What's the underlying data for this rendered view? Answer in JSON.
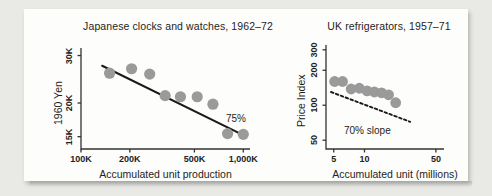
{
  "page": {
    "background_color": "#e9e9e6",
    "card_color": "#fdfdfb"
  },
  "style": {
    "marker_color": "#9a9a9a",
    "line_color": "#1a1a1a",
    "axis_color": "#333333",
    "text_color": "#1d1d1d"
  },
  "chart_data": [
    {
      "id": "japanese-clocks-watches",
      "type": "scatter",
      "title": "Japanese clocks and watches, 1962–72",
      "xlabel": "Accumulated unit production",
      "ylabel": "1960 Yen",
      "xscale": "log",
      "yscale": "log",
      "xticks": [
        "100K",
        "200K",
        "500K",
        "1,000K"
      ],
      "xtick_values": [
        100000,
        200000,
        500000,
        1000000
      ],
      "yticks": [
        "15K",
        "20K",
        "30K"
      ],
      "ytick_values": [
        15000,
        20000,
        30000
      ],
      "xlim": [
        100000,
        1100000
      ],
      "ylim": [
        13500,
        32000
      ],
      "grid": false,
      "annotation": "75%",
      "trend_label": "75%",
      "trend": {
        "x0": 135000,
        "y0": 27500,
        "x1": 1000000,
        "y1": 15200
      },
      "points": [
        {
          "x": 150000,
          "y": 25800
        },
        {
          "x": 205000,
          "y": 26800
        },
        {
          "x": 265000,
          "y": 25600
        },
        {
          "x": 330000,
          "y": 21300
        },
        {
          "x": 410000,
          "y": 21100
        },
        {
          "x": 520000,
          "y": 21100
        },
        {
          "x": 650000,
          "y": 19800
        },
        {
          "x": 800000,
          "y": 15400
        },
        {
          "x": 1000000,
          "y": 15300
        }
      ]
    },
    {
      "id": "uk-refrigerators",
      "type": "scatter",
      "title": "UK refrigerators, 1957–71",
      "xlabel": "Accumulated unit (millions)",
      "ylabel": "Price Index",
      "xscale": "log",
      "yscale": "log",
      "xticks": [
        "5",
        "10",
        "50"
      ],
      "xtick_values": [
        5,
        10,
        50
      ],
      "yticks": [
        "50",
        "100",
        "200",
        "300"
      ],
      "ytick_values": [
        50,
        100,
        200,
        300
      ],
      "xlim": [
        4.2,
        60
      ],
      "ylim": [
        42,
        330
      ],
      "grid": false,
      "annotation": "70% slope",
      "trend_label": "70% slope",
      "trend": {
        "x0": 4.7,
        "y0": 130,
        "x1": 28,
        "y1": 72
      },
      "points": [
        {
          "x": 5.1,
          "y": 160
        },
        {
          "x": 6.1,
          "y": 160
        },
        {
          "x": 7.4,
          "y": 138
        },
        {
          "x": 8.9,
          "y": 140
        },
        {
          "x": 10.6,
          "y": 133
        },
        {
          "x": 12.5,
          "y": 130
        },
        {
          "x": 14.7,
          "y": 128
        },
        {
          "x": 17.2,
          "y": 123
        },
        {
          "x": 20.2,
          "y": 105
        }
      ]
    }
  ]
}
